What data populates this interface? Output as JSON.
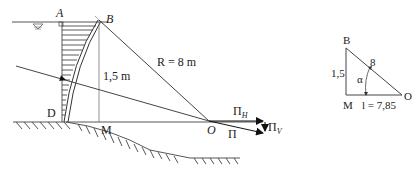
{
  "diagram": {
    "main": {
      "labels": {
        "A": "A",
        "B": "B",
        "D": "D",
        "M": "M",
        "O": "O",
        "height": "1,5 m",
        "radius": "R = 8 m",
        "force_total": "Π",
        "force_h": "Π",
        "force_h_sub": "H",
        "force_v": "Π",
        "force_v_sub": "V"
      },
      "water_symbol": "water-level"
    },
    "triangle": {
      "labels": {
        "B": "B",
        "M": "M",
        "O": "O",
        "side_vertical": "1,5",
        "hypotenuse": "8",
        "angle": "α",
        "side_horizontal": "l = 7,85"
      }
    }
  }
}
